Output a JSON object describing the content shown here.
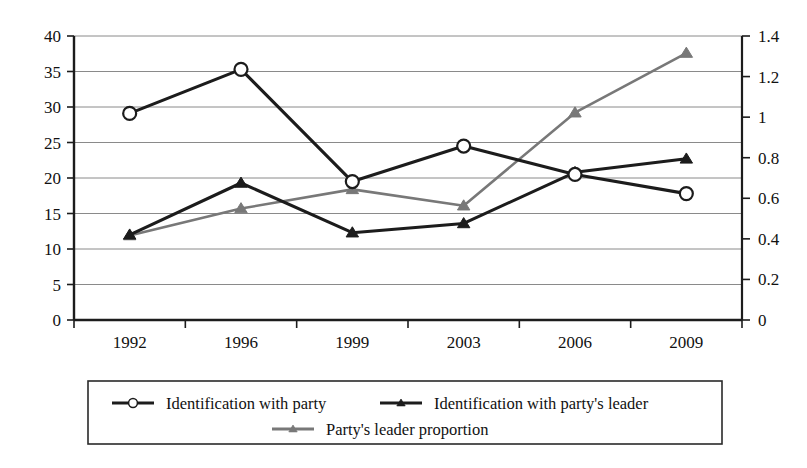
{
  "chart_data": {
    "type": "line",
    "title": "",
    "subtitle": "",
    "xlabel": "",
    "ylabel": "",
    "categories": [
      "1992",
      "1996",
      "1999",
      "2003",
      "2006",
      "2009"
    ],
    "grid": true,
    "legend_position": "bottom",
    "axes": {
      "left": {
        "ylim": [
          0,
          40
        ],
        "ticks": [
          "0",
          "5",
          "10",
          "15",
          "20",
          "25",
          "30",
          "35",
          "40"
        ],
        "tick_values": [
          0,
          5,
          10,
          15,
          20,
          25,
          30,
          35,
          40
        ]
      },
      "right": {
        "ylim": [
          0,
          1.4
        ],
        "ticks": [
          "0",
          "0.2",
          "0.4",
          "0.6",
          "0.8",
          "1",
          "1.2",
          "1.4"
        ],
        "tick_values": [
          0,
          0.2,
          0.4,
          0.6,
          0.8,
          1.0,
          1.2,
          1.4
        ]
      }
    },
    "series": [
      {
        "name": "Identification with party",
        "axis": "left",
        "marker": "open-circle",
        "color": "#1c1c1c",
        "values": [
          29.1,
          35.3,
          19.5,
          24.5,
          20.5,
          17.8
        ]
      },
      {
        "name": "Identification with party's leader",
        "axis": "left",
        "marker": "filled-triangle",
        "color": "#1c1c1c",
        "values": [
          12.0,
          19.3,
          12.3,
          13.6,
          20.8,
          22.7
        ]
      },
      {
        "name": "Party's leader proportion",
        "axis": "left",
        "marker": "filled-triangle",
        "color": "#787878",
        "values": [
          11.9,
          15.7,
          18.4,
          16.1,
          29.2,
          37.6
        ]
      }
    ]
  },
  "legend": {
    "items": [
      {
        "label": "Identification with party",
        "marker": "open-circle",
        "color": "#1c1c1c"
      },
      {
        "label": "Identification with party's leader",
        "marker": "filled-triangle",
        "color": "#1c1c1c"
      },
      {
        "label": "Party's leader proportion",
        "marker": "filled-triangle",
        "color": "#787878"
      }
    ]
  }
}
